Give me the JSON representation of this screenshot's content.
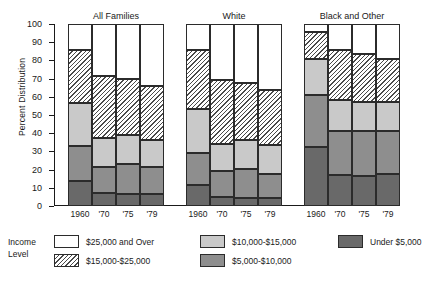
{
  "axis": {
    "ylabel": "Percent Distribution",
    "yticks": [
      0,
      10,
      20,
      30,
      40,
      50,
      60,
      70,
      80,
      90,
      100
    ],
    "ymin": 0,
    "ymax": 100
  },
  "legend": {
    "title_line1": "Income",
    "title_line2": "Level",
    "items": [
      {
        "label": "$25,000 and Over",
        "key": "over25",
        "color": "#ffffff"
      },
      {
        "label": "$15,000-$25,000",
        "key": "15to25",
        "color": "#ffffff"
      },
      {
        "label": "$10,000-$15,000",
        "key": "10to15",
        "color": "#c9c9c9"
      },
      {
        "label": "$5,000-$10,000",
        "key": "5to10",
        "color": "#8e8e8e"
      },
      {
        "label": "Under $5,000",
        "key": "under5",
        "color": "#696969"
      }
    ]
  },
  "chart_data": {
    "type": "bar",
    "subtype": "stacked-percent",
    "title": "",
    "xlabel": "",
    "ylabel": "Percent Distribution",
    "ylim": [
      0,
      100
    ],
    "grid": false,
    "legend_position": "bottom",
    "categories": [
      "1960",
      "'70",
      "'75",
      "'79"
    ],
    "groups": [
      "All Families",
      "White",
      "Black and Other"
    ],
    "series": [
      {
        "name": "Under $5,000",
        "color": "#696969",
        "values": {
          "All Families": [
            14.0,
            7.0,
            6.5,
            6.5
          ],
          "White": [
            11.5,
            5.0,
            4.5,
            4.5
          ],
          "Black and Other": [
            32.5,
            17.0,
            16.5,
            17.5
          ]
        }
      },
      {
        "name": "$5,000-$10,000",
        "color": "#8e8e8e",
        "values": {
          "All Families": [
            19.0,
            14.5,
            16.5,
            15.0
          ],
          "White": [
            17.5,
            14.0,
            16.0,
            13.0
          ],
          "Black and Other": [
            28.5,
            24.0,
            24.5,
            23.5
          ]
        }
      },
      {
        "name": "$10,000-$15,000",
        "color": "#c9c9c9",
        "values": {
          "All Families": [
            23.5,
            16.0,
            16.0,
            14.5
          ],
          "White": [
            24.5,
            15.0,
            15.5,
            16.0
          ],
          "Black and Other": [
            19.5,
            17.5,
            16.5,
            16.0
          ]
        }
      },
      {
        "name": "$15,000-$25,000",
        "color": "#ffffff",
        "hatch": true,
        "values": {
          "All Families": [
            29.0,
            34.0,
            31.0,
            30.0
          ],
          "White": [
            32.0,
            35.0,
            31.5,
            30.0
          ],
          "Black and Other": [
            15.0,
            27.0,
            26.5,
            24.0
          ]
        }
      },
      {
        "name": "$25,000 and Over",
        "color": "#ffffff",
        "values": {
          "All Families": [
            14.5,
            28.5,
            30.0,
            34.0
          ],
          "White": [
            14.5,
            31.0,
            32.5,
            36.5
          ],
          "Black and Other": [
            4.5,
            14.5,
            16.5,
            19.0
          ]
        }
      }
    ],
    "cumulative_tops": {
      "All Families": [
        [
          14.0,
          33.0,
          56.5,
          85.5,
          100
        ],
        [
          7.0,
          21.5,
          37.5,
          71.5,
          100
        ],
        [
          6.5,
          23.0,
          39.0,
          70.0,
          100
        ],
        [
          6.5,
          21.5,
          36.0,
          66.0,
          100
        ]
      ],
      "White": [
        [
          11.5,
          29.0,
          53.5,
          85.5,
          100
        ],
        [
          5.0,
          19.0,
          34.0,
          69.0,
          100
        ],
        [
          4.5,
          20.5,
          36.0,
          67.5,
          100
        ],
        [
          4.5,
          17.5,
          33.5,
          63.5,
          100
        ]
      ],
      "Black and Other": [
        [
          32.5,
          61.0,
          80.5,
          95.5,
          100
        ],
        [
          17.0,
          41.0,
          58.5,
          85.5,
          100
        ],
        [
          16.5,
          41.0,
          57.0,
          83.5,
          100
        ],
        [
          17.5,
          41.0,
          57.0,
          81.0,
          100
        ]
      ]
    }
  }
}
